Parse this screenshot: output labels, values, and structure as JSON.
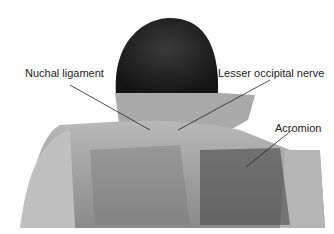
{
  "figure": {
    "labels": [
      {
        "text": "Nuchal ligament",
        "x": 25,
        "y": 67
      },
      {
        "text": "Lesser occipital nerve",
        "x": 218,
        "y": 67
      },
      {
        "text": "Acromion",
        "x": 275,
        "y": 122
      }
    ]
  }
}
